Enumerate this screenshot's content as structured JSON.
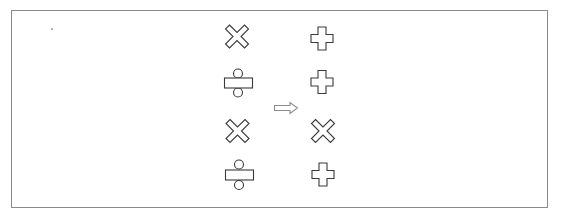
{
  "figure": {
    "border_color": "#8a8a8a",
    "shape_stroke_color": "#3a3a3a",
    "arrow_color": "#8c8c8c",
    "left_column": [
      {
        "row": 1,
        "symbol": "multiply",
        "icon": "multiply-icon"
      },
      {
        "row": 2,
        "symbol": "divide",
        "icon": "divide-icon"
      },
      {
        "row": 3,
        "symbol": "multiply",
        "icon": "multiply-icon"
      },
      {
        "row": 4,
        "symbol": "divide",
        "icon": "divide-icon"
      }
    ],
    "arrow": {
      "direction": "right",
      "icon": "double-arrow-right-icon"
    },
    "right_column": [
      {
        "row": 1,
        "symbol": "plus",
        "icon": "plus-icon"
      },
      {
        "row": 2,
        "symbol": "plus",
        "icon": "plus-icon"
      },
      {
        "row": 3,
        "symbol": "multiply",
        "icon": "multiply-icon"
      },
      {
        "row": 4,
        "symbol": "plus",
        "icon": "plus-icon"
      }
    ]
  }
}
